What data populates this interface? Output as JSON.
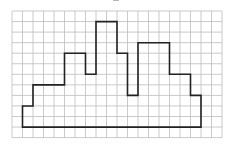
{
  "diagram": {
    "type": "grid-polygon",
    "grid": {
      "columns": 20,
      "rows": 12,
      "origin_x": 12,
      "origin_y": 11,
      "cell_w": 10.5,
      "cell_h": 10.55,
      "line_color": "#bdbdbd"
    },
    "shape": {
      "stroke": "#222222",
      "stroke_width": 1.6,
      "vertices": [
        [
          1,
          11
        ],
        [
          1,
          9
        ],
        [
          2,
          9
        ],
        [
          2,
          7
        ],
        [
          5,
          7
        ],
        [
          5,
          4
        ],
        [
          7,
          4
        ],
        [
          7,
          6
        ],
        [
          8,
          6
        ],
        [
          8,
          1
        ],
        [
          10,
          1
        ],
        [
          10,
          4
        ],
        [
          11,
          4
        ],
        [
          11,
          8
        ],
        [
          12,
          8
        ],
        [
          12,
          3
        ],
        [
          15,
          3
        ],
        [
          15,
          6
        ],
        [
          17,
          6
        ],
        [
          17,
          8
        ],
        [
          18,
          8
        ],
        [
          18,
          11
        ]
      ]
    }
  }
}
